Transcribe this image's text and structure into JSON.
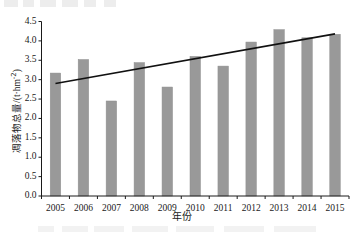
{
  "chart_data": {
    "type": "bar",
    "title": "",
    "subtitle": "",
    "xlabel": "年份",
    "ylabel": "凋落物总量/(t·hm⁻²)",
    "ylabel_main": "凋落物总量",
    "ylabel_unit_prefix": "/(t·hm",
    "ylabel_unit_exponent": "-2",
    "ylabel_unit_suffix": ")",
    "categories": [
      "2005",
      "2006",
      "2007",
      "2008",
      "2009",
      "2010",
      "2011",
      "2012",
      "2013",
      "2014",
      "2015"
    ],
    "values": [
      3.17,
      3.52,
      2.45,
      3.44,
      2.81,
      3.6,
      3.35,
      3.97,
      4.29,
      4.08,
      4.17
    ],
    "ylim": [
      0.0,
      4.5
    ],
    "yticks": [
      "0.0",
      "0.5",
      "1.0",
      "1.5",
      "2.0",
      "2.5",
      "3.0",
      "3.5",
      "4.0",
      "4.5"
    ],
    "ytick_values": [
      0.0,
      0.5,
      1.0,
      1.5,
      2.0,
      2.5,
      3.0,
      3.5,
      4.0,
      4.5
    ],
    "grid": false,
    "legend": "none",
    "series": [
      {
        "name": "凋落物总量",
        "type": "bar",
        "color": "#999999",
        "values": [
          3.17,
          3.52,
          2.45,
          3.44,
          2.81,
          3.6,
          3.35,
          3.97,
          4.29,
          4.08,
          4.17
        ]
      },
      {
        "name": "趋势线",
        "type": "line",
        "color": "#111111",
        "x": [
          "2005",
          "2015"
        ],
        "values": [
          2.9,
          4.18
        ]
      }
    ],
    "trendline": {
      "start_year": "2005",
      "start_value": 2.9,
      "end_year": "2015",
      "end_value": 4.18,
      "color": "#111111"
    },
    "colors": {
      "bar": "#999999",
      "bar_edge": "#8f8f8f",
      "trendline": "#111111",
      "axis": "#1a1a1a",
      "background": "#ffffff",
      "text": "#1a1a1a"
    },
    "axes": {
      "show_left": true,
      "show_bottom": true,
      "show_top": false,
      "show_right": false,
      "tick_direction": "out"
    }
  }
}
